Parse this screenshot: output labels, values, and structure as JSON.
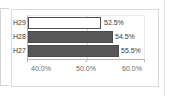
{
  "chart_data": {
    "type": "bar",
    "orientation": "horizontal",
    "title": "",
    "xlabel": "",
    "ylabel": "",
    "categories": [
      "H27",
      "H28",
      "H29"
    ],
    "values": [
      55.5,
      54.5,
      52.5
    ],
    "data_labels": [
      "55.5%",
      "54.5%",
      "52.5%"
    ],
    "xlim": [
      40.0,
      60.0
    ],
    "xticks": [
      40.0,
      50.0,
      60.0
    ],
    "xtick_labels": [
      "40.0%",
      "50.0%",
      "60.0%"
    ],
    "grid": true,
    "legend": "none",
    "series": [
      {
        "name": "",
        "points": [
          {
            "category": "H29",
            "value": 52.5,
            "label": "52.5%",
            "fill": "#ffffff",
            "stroke": "#4f4f4f"
          },
          {
            "category": "H28",
            "value": 54.5,
            "label": "54.5%",
            "fill": "#585858",
            "stroke": "#4a4a4a"
          },
          {
            "category": "H27",
            "value": 55.5,
            "label": "55.5%",
            "fill": "#585858",
            "stroke": "#4a4a4a"
          }
        ]
      }
    ]
  },
  "rows": [
    {
      "category": "H29",
      "label": "52.5%"
    },
    {
      "category": "H28",
      "label": "54.5%"
    },
    {
      "category": "H27",
      "label": "55.5%"
    }
  ],
  "axis": {
    "tick_0": "40.0%",
    "tick_1": "50.0%",
    "tick_2": "60.0%"
  },
  "colors": {
    "bar_fill": "#585858",
    "bar_stroke": "#4a4a4a",
    "hollow_fill": "#ffffff",
    "gridline": "#d8d8d8",
    "axis": "#b6b6b6",
    "text": "#3a3a3a",
    "tick_text": "#6a6a6a",
    "frame": "#d9d9d9"
  }
}
